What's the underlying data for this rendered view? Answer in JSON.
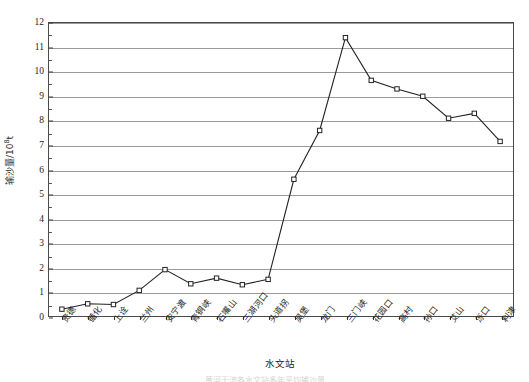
{
  "chart_data": {
    "type": "line",
    "title": "",
    "xlabel": "水文站",
    "ylabel_text": "输沙量/10",
    "ylabel_exponent": "8",
    "ylabel_unit": "t",
    "ylabel_full": "输沙量/10⁸t",
    "categories": [
      "贵德",
      "循化",
      "上诠",
      "兰州",
      "安宁渡",
      "青铜峡",
      "石嘴山",
      "三湖河口",
      "头道拐",
      "吴堡",
      "龙门",
      "三门峡",
      "花园口",
      "高村",
      "孙口",
      "艾山",
      "泺口",
      "利津"
    ],
    "values": [
      0.28,
      0.5,
      0.47,
      1.05,
      1.9,
      1.32,
      1.55,
      1.28,
      1.5,
      5.6,
      7.6,
      11.4,
      9.65,
      9.3,
      9.0,
      8.1,
      8.3,
      7.15
    ],
    "series": [
      {
        "name": "输沙量",
        "values": [
          0.28,
          0.5,
          0.47,
          1.05,
          1.9,
          1.32,
          1.55,
          1.28,
          1.5,
          5.6,
          7.6,
          11.4,
          9.65,
          9.3,
          9.0,
          8.1,
          8.3,
          7.15
        ]
      }
    ],
    "yticks": [
      0,
      1,
      2,
      3,
      4,
      5,
      6,
      7,
      8,
      9,
      10,
      11,
      12
    ],
    "ytick_labels": [
      "0",
      "1",
      "2",
      "3",
      "4",
      "5",
      "6",
      "7",
      "8",
      "9",
      "10",
      "11",
      "12"
    ],
    "ylim": [
      0,
      12
    ],
    "grid": "horizontal",
    "legend": "none",
    "marker": "open-square",
    "line_color": "#222222",
    "grid_color": "#9a9a9a",
    "axis_color": "#4a4a4a"
  },
  "caption": "黄河干流各水文站多年平均输沙量",
  "axis_title": {
    "x": "水文站",
    "y": "输沙量/10⁸t"
  }
}
